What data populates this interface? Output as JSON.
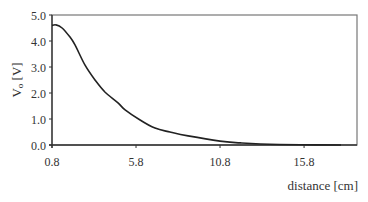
{
  "chart_data": {
    "type": "line",
    "title": "",
    "xlabel": "distance [cm]",
    "ylabel": "Vo [V]",
    "ylabel_main": "V",
    "ylabel_sub": "o",
    "ylabel_unit": " [V]",
    "xlim": [
      0.8,
      18.95
    ],
    "ylim": [
      0.0,
      5.0
    ],
    "x_ticks": [
      0.8,
      5.8,
      10.8,
      15.8
    ],
    "x_tick_labels": [
      "0.8",
      "5.8",
      "10.8",
      "15.8"
    ],
    "y_ticks": [
      0,
      1,
      2,
      3,
      4,
      5
    ],
    "y_tick_labels": [
      "0.0",
      "1.0",
      "2.0",
      "3.0",
      "4.0",
      "5.0"
    ],
    "grid": false,
    "legend": null,
    "series": [
      {
        "name": "Vo",
        "color": "#222222",
        "x": [
          0.8,
          1.04,
          1.4,
          1.87,
          2.17,
          2.76,
          3.36,
          3.95,
          4.73,
          5.15,
          6.04,
          6.93,
          7.82,
          8.9,
          10.8,
          12.0,
          13.2,
          15.6,
          18.0
        ],
        "y": [
          4.6,
          4.62,
          4.5,
          4.15,
          3.85,
          3.08,
          2.5,
          2.04,
          1.62,
          1.35,
          0.96,
          0.65,
          0.5,
          0.35,
          0.15,
          0.08,
          0.04,
          0.01,
          0.0
        ]
      }
    ]
  }
}
